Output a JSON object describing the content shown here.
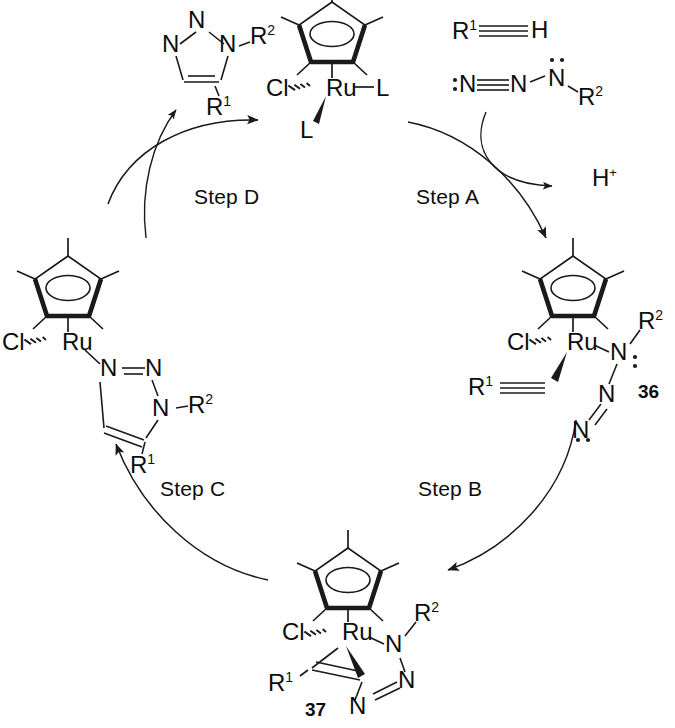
{
  "diagram": {
    "type": "catalytic-cycle",
    "direction": "clockwise",
    "steps": [
      {
        "id": "A",
        "label": "Step A",
        "from": "catalyst",
        "to": "complex-36"
      },
      {
        "id": "B",
        "label": "Step B",
        "from": "complex-36",
        "to": "complex-37"
      },
      {
        "id": "C",
        "label": "Step C",
        "from": "complex-37",
        "to": "complex-triazolyl"
      },
      {
        "id": "D",
        "label": "Step D",
        "from": "complex-triazolyl",
        "to": "catalyst"
      }
    ],
    "reagents": {
      "alkyne": {
        "r_group": "R",
        "r_sup": "1",
        "terminus": "H",
        "bond": "triple"
      },
      "azide": {
        "n1": "N",
        "n2": "N",
        "n3": "N",
        "r_group": "R",
        "r_sup": "2",
        "lone_pairs": [
          "N1-left",
          "N3-top"
        ]
      },
      "byproduct": {
        "label": "H",
        "charge": "+"
      }
    },
    "product": {
      "name": "1,5-disubstituted triazole",
      "ring_atoms": [
        "N",
        "N",
        "N"
      ],
      "substituent_1": "R",
      "substituent_1_sup": "2",
      "substituent_2": "R",
      "substituent_2_sup": "1"
    },
    "structures": [
      {
        "id": "catalyst",
        "position": "top",
        "metal": "Ru",
        "ligands": [
          "Cl",
          "L",
          "L"
        ],
        "cp_star": true,
        "number": ""
      },
      {
        "id": "complex-36",
        "position": "right",
        "metal": "Ru",
        "ligands": [
          "Cl",
          "alkyne",
          "azide"
        ],
        "cp_star": true,
        "number": "36",
        "atom_labels": [
          "Cl",
          "Ru",
          "N",
          "N",
          "N",
          "R",
          "R"
        ]
      },
      {
        "id": "complex-37",
        "position": "bottom",
        "metal": "Ru",
        "ligands": [
          "Cl",
          "metallacycle"
        ],
        "cp_star": true,
        "number": "37",
        "atom_labels": [
          "Cl",
          "Ru",
          "N",
          "N",
          "N",
          "R",
          "R"
        ]
      },
      {
        "id": "complex-triazolyl",
        "position": "left",
        "metal": "Ru",
        "ligands": [
          "Cl",
          "triazolyl"
        ],
        "cp_star": true,
        "number": "",
        "atom_labels": [
          "Cl",
          "Ru",
          "N",
          "N",
          "N",
          "R",
          "R"
        ]
      }
    ],
    "atoms": {
      "Ru": "Ru",
      "Cl": "Cl",
      "N": "N",
      "L": "L",
      "H": "H",
      "R": "R"
    }
  }
}
